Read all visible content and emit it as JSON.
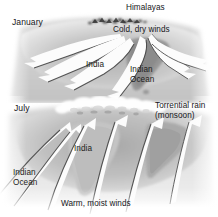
{
  "figure": {
    "title_visible": false,
    "width": 218,
    "height": 217,
    "background_color": "#ffffff",
    "text_color": "#16161a"
  },
  "panels": [
    {
      "id": "january",
      "season_label": "January",
      "labels": {
        "season": "January",
        "mountains": "Himalayas",
        "winds": "Cold, dry winds",
        "landmass": "India",
        "ocean": "Indian\nOcean"
      },
      "wind_direction": "outward from land to sea",
      "arrow_count": 6
    },
    {
      "id": "july",
      "season_label": "July",
      "labels": {
        "season": "July",
        "rain": "Torrential rain\n(monsoon)",
        "landmass": "India",
        "ocean": "Indian\nOcean",
        "winds": "Warm, moist winds"
      },
      "wind_direction": "inward from sea to land",
      "arrow_count": 6
    }
  ],
  "labels_flat": {
    "january": "January",
    "himalayas": "Himalayas",
    "cold_dry_winds": "Cold, dry winds",
    "india_top": "India",
    "indian_ocean_top_line1": "Indian",
    "indian_ocean_top_line2": "Ocean",
    "july": "July",
    "torrential_rain_line1": "Torrential rain",
    "torrential_rain_line2": "(monsoon)",
    "india_bottom": "India",
    "indian_ocean_bottom_line1": "Indian",
    "indian_ocean_bottom_line2": "Ocean",
    "warm_moist_winds": "Warm, moist winds"
  },
  "colors": {
    "land_light": "#d9d9d9",
    "land_mid": "#b9b9b9",
    "land_dark": "#8e8e8e",
    "sea": "#cfcfcf",
    "arrow_fill": "#fdfdfd",
    "arrow_shadow": "#2e2e2e",
    "cloud": "#efefef",
    "mountain": "#4a4a4a",
    "text": "#16161a",
    "background": "#ffffff"
  }
}
